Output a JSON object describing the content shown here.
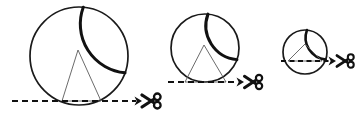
{
  "figure": {
    "background_color": "#ffffff",
    "width": 360,
    "height": 120,
    "stroke_color_circle": "#1a1a1a",
    "stroke_color_triangle": "#5a5a5a",
    "stroke_color_cutline": "#111111",
    "scissors_icon_name": "scissors-icon",
    "cut_line_style": "dashed"
  },
  "panels": [
    {
      "id": "panel-large",
      "label": "large-circle-panel",
      "circle": {
        "cx": 79,
        "cy": 56,
        "r": 49,
        "stroke_width": 1.7,
        "heavy_arc_stroke_width": 3.0
      },
      "triangle": {
        "apex_x": 78,
        "apex_y": 50,
        "base_left_x": 62,
        "base_right_x": 101,
        "base_y": 101,
        "stroke_width": 0.9
      },
      "cut_line": {
        "x1": 12,
        "x2": 136,
        "y": 101,
        "stroke_width": 2.2,
        "dash": "6,4"
      },
      "arrow": {
        "tip_x": 142,
        "y": 101
      },
      "scissors": {
        "x": 140,
        "y": 101,
        "scale": 1.0
      }
    },
    {
      "id": "panel-medium",
      "label": "medium-circle-panel",
      "circle": {
        "cx": 205,
        "cy": 48,
        "r": 34,
        "stroke_width": 1.7,
        "heavy_arc_stroke_width": 3.0
      },
      "triangle": {
        "apex_x": 204,
        "apex_y": 45,
        "base_left_x": 185,
        "base_right_x": 226,
        "base_y": 82,
        "stroke_width": 0.9
      },
      "cut_line": {
        "x1": 168,
        "x2": 238,
        "y": 82,
        "stroke_width": 2.2,
        "dash": "6,4"
      },
      "arrow": {
        "tip_x": 244,
        "y": 82
      },
      "scissors": {
        "x": 242,
        "y": 82,
        "scale": 0.95
      }
    },
    {
      "id": "panel-small",
      "label": "small-circle-panel",
      "circle": {
        "cx": 305,
        "cy": 52,
        "r": 22,
        "stroke_width": 1.7,
        "heavy_arc_stroke_width": 2.6
      },
      "triangle": {
        "apex_x": 305,
        "apex_y": 44,
        "base_left_x": 288,
        "base_right_x": 322,
        "base_y": 61,
        "stroke_width": 0.9
      },
      "cut_line": {
        "x1": 281,
        "x2": 330,
        "y": 61,
        "stroke_width": 2.2,
        "dash": "5,3.5"
      },
      "arrow": {
        "tip_x": 336,
        "y": 61
      },
      "scissors": {
        "x": 334,
        "y": 61,
        "scale": 0.9
      }
    }
  ]
}
